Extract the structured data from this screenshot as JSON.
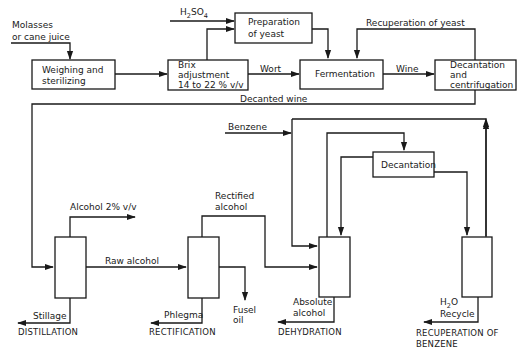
{
  "inputs": {
    "molasses_line1": "Molasses",
    "molasses_line2": "or cane juice",
    "h2so4_main": "H",
    "h2so4_sub2": "2",
    "h2so4_so": "SO",
    "h2so4_sub4": "4",
    "benzene": "Benzene"
  },
  "boxes": {
    "weighing_line1": "Weighing and",
    "weighing_line2": "sterilizing",
    "brix_line1": "Brix",
    "brix_line2": "adjustment",
    "brix_line3": "14 to 22 % v/v",
    "yeast_line1": "Preparation",
    "yeast_line2": "of yeast",
    "fermentation": "Fermentation",
    "decant_centri_line1": "Decantation",
    "decant_centri_line2": "and",
    "decant_centri_line3": "centrifugation",
    "decantation": "Decantation"
  },
  "flows": {
    "wort": "Wort",
    "wine": "Wine",
    "recuperation_of_yeast": "Recuperation  of  yeast",
    "decanted_wine": "Decanted  wine",
    "alcohol_2": "Alcohol 2% v/v",
    "raw_alcohol": "Raw alcohol",
    "rectified_line1": "Rectified",
    "rectified_line2": "alcohol",
    "stillage": "Stillage",
    "phlegma": "Phlegma",
    "fusel_line1": "Fusel",
    "fusel_line2": "oil",
    "absolute_line1": "Absolute",
    "absolute_line2": "alcohol",
    "h2o_main": "H",
    "h2o_sub": "2",
    "h2o_o": "O",
    "recycle": "Recycle"
  },
  "stages": {
    "distillation": "DISTILLATION",
    "rectification": "RECTIFICATION",
    "dehydration": "DEHYDRATION",
    "recuperation_line1": "RECUPERATION OF",
    "recuperation_line2": "BENZENE"
  }
}
